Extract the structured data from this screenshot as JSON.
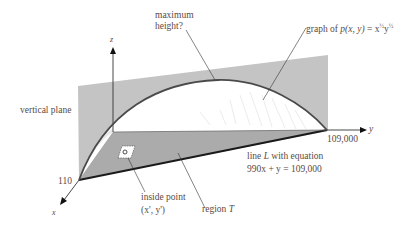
{
  "labels": {
    "max_height": [
      "maximum",
      "height?"
    ],
    "graph_prefix": "graph of ",
    "graph_func": "p(x, y)",
    "graph_eq": " = x",
    "graph_exp1": "½",
    "graph_y": "y",
    "graph_exp2": "½",
    "vertical_plane": "vertical plane",
    "z_axis": "z",
    "y_axis": "y",
    "x_axis": "x",
    "x_intercept": "110",
    "y_intercept": "109,000",
    "line_L_1a": "line ",
    "line_L_1b": "L",
    "line_L_1c": " with equation",
    "line_L_2": "990x + y = 109,000",
    "inside_point_1": "inside point",
    "inside_point_2": "(x', y')",
    "region_a": "region ",
    "region_b": "T",
    "point_marker": "Q"
  },
  "colors": {
    "plane": "#bdbdbd",
    "floor": "#a9a9a9",
    "curve": "#4a4a4a",
    "text": "#5a4a45"
  }
}
